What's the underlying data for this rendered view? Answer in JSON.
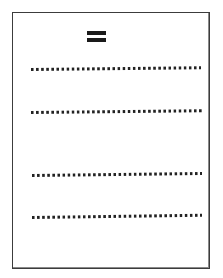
{
  "document": {
    "kind": "scanned-page",
    "page_background_color": "#ffffff",
    "border_color": "#3c3c3c",
    "ink_color": "#1a1a1a",
    "canvas": {
      "width": 223,
      "height": 278
    },
    "header_mark": {
      "name": "equals-sign",
      "glyph": "=",
      "bars": 2
    },
    "text_lines": [
      {
        "id": "line-1",
        "style": "dotted",
        "dot_count": 34,
        "label": "redacted text line 1"
      },
      {
        "id": "line-2",
        "style": "dotted",
        "dot_count": 34,
        "label": "redacted text line 2"
      },
      {
        "id": "line-3",
        "style": "dotted",
        "dot_count": 34,
        "label": "redacted text line 3"
      },
      {
        "id": "line-4",
        "style": "dotted",
        "dot_count": 34,
        "label": "redacted text line 4"
      }
    ]
  }
}
